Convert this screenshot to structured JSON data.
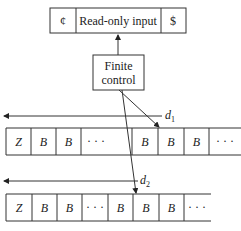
{
  "input_tape": {
    "left_marker": "¢",
    "label": "Read-only input",
    "right_marker": "$"
  },
  "finite_control": {
    "line1": "Finite",
    "line2": "control"
  },
  "tape1": {
    "direction_label": "d",
    "direction_sub": "1",
    "cells": [
      "Z",
      "B",
      "B",
      "· · ·",
      "B",
      "B",
      "B",
      "· · ·"
    ]
  },
  "tape2": {
    "direction_label": "d",
    "direction_sub": "2",
    "cells": [
      "Z",
      "B",
      "B",
      "· · ·",
      "B",
      "B",
      "B",
      "· · ·"
    ]
  }
}
